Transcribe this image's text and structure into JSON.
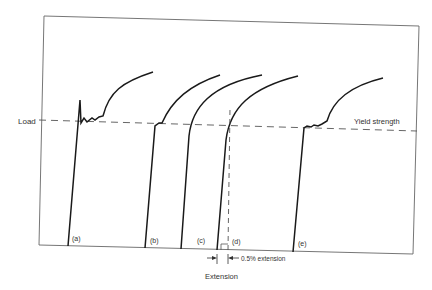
{
  "diagram": {
    "y_label": "Load",
    "x_label": "Extension",
    "yield_label": "Yield strength",
    "offset_label": "0.5% extension",
    "curves": [
      {
        "id": "a",
        "label": "(a)"
      },
      {
        "id": "b",
        "label": "(b)"
      },
      {
        "id": "c",
        "label": "(c)"
      },
      {
        "id": "d",
        "label": "(d)"
      },
      {
        "id": "e",
        "label": "(e)"
      }
    ],
    "colors": {
      "line": "#1a1a1a",
      "axis": "#555555",
      "text": "#333333"
    }
  }
}
